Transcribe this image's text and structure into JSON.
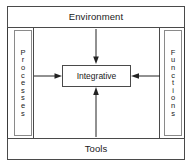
{
  "diagram": {
    "top_label": "Environment",
    "bottom_label": "Tools",
    "left_label": "Processes",
    "right_label": "Functions",
    "center_label": "Integrative",
    "left_label_letters": [
      "P",
      "r",
      "o",
      "c",
      "e",
      "s",
      "s",
      "e",
      "s"
    ],
    "right_label_letters": [
      "F",
      "u",
      "n",
      "c",
      "t",
      "i",
      "o",
      "n",
      "s"
    ],
    "arrows": [
      {
        "name": "arrow-environment-to-integrative",
        "direction": "down",
        "from": "Environment",
        "to": "Integrative"
      },
      {
        "name": "arrow-processes-to-integrative",
        "direction": "right",
        "from": "Processes",
        "to": "Integrative"
      },
      {
        "name": "arrow-functions-to-integrative",
        "direction": "left",
        "from": "Functions",
        "to": "Integrative"
      },
      {
        "name": "arrow-tools-to-integrative",
        "direction": "up",
        "from": "Tools",
        "to": "Integrative"
      }
    ],
    "colors": {
      "frame_stroke": "#3a3a3a",
      "box_stroke": "#4a4a4a",
      "side_box_stroke": "#8a8a8a",
      "arrow_stroke": "#222222",
      "text": "#1a1a1a",
      "background": "#ffffff"
    }
  }
}
